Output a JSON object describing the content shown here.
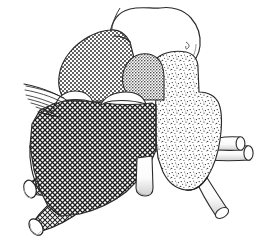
{
  "figure": {
    "title": "Anatomical line drawing of brainstem with nerve roots",
    "domain": "Diagram",
    "width": 261,
    "height": 243,
    "background_color": "#ffffff",
    "line_color": "#1a1a1a",
    "style": "pen-and-ink stipple and crosshatch medical illustration",
    "caption": ""
  },
  "palette": {
    "outline": "#262626",
    "white_fill": "#ffffff",
    "dark_crosshatch": "#4a4a4a",
    "medium_dot": "#8c8c8c",
    "light_stipple": "#b8b8b8",
    "mid_gray_knob": "#707070",
    "tube_shadow": "#d8d8d8"
  },
  "regions": [
    {
      "id": "upper-white-lobe",
      "name": "upper-white-lobe",
      "label": "Upper unshaded lobe",
      "texture": "none",
      "fill": "#ffffff",
      "bbox": [
        108,
        6,
        96,
        60
      ]
    },
    {
      "id": "upper-left-dotted-mass",
      "name": "upper-left-dotted-mass",
      "label": "Upper left medium-dot mass",
      "texture": "medium-dot",
      "fill": "#8c8c8c",
      "bbox": [
        60,
        32,
        80,
        80
      ]
    },
    {
      "id": "central-dark-knob",
      "name": "central-dark-knob",
      "label": "Central mid-gray knob",
      "texture": "fine-dot",
      "fill": "#707070",
      "bbox": [
        122,
        54,
        46,
        50
      ]
    },
    {
      "id": "left-dark-crosshatch-body",
      "name": "left-dark-crosshatch-body",
      "label": "Left dark crosshatched body",
      "texture": "crosshatch",
      "fill": "#4a4a4a",
      "bbox": [
        20,
        100,
        140,
        130
      ]
    },
    {
      "id": "right-light-stipple-body",
      "name": "right-light-stipple-body",
      "label": "Right light stippled body",
      "texture": "stipple",
      "fill": "#b8b8b8",
      "bbox": [
        152,
        50,
        70,
        140
      ]
    }
  ],
  "tubes": [
    {
      "id": "tube-left-1",
      "name": "left-root-tube-1",
      "label": "Left root 1 (upper)",
      "texture": "crosshatch",
      "angle_deg": 186
    },
    {
      "id": "tube-left-2",
      "name": "left-root-tube-2",
      "label": "Left root 2",
      "texture": "crosshatch",
      "angle_deg": 192
    },
    {
      "id": "tube-left-3",
      "name": "left-root-tube-3",
      "label": "Left root 3",
      "texture": "crosshatch",
      "angle_deg": 205
    },
    {
      "id": "tube-left-4",
      "name": "left-root-tube-4",
      "label": "Left root 4 (lower)",
      "texture": "crosshatch",
      "angle_deg": 218
    },
    {
      "id": "tube-center-down",
      "name": "center-descending-tube",
      "label": "Central descending tube",
      "texture": "none",
      "angle_deg": 268
    },
    {
      "id": "tube-right-upper-a",
      "name": "right-lateral-tube-a",
      "label": "Right lateral tube A",
      "texture": "none",
      "angle_deg": 8
    },
    {
      "id": "tube-right-upper-b",
      "name": "right-lateral-tube-b",
      "label": "Right lateral tube B",
      "texture": "none",
      "angle_deg": 14
    },
    {
      "id": "tube-right-down",
      "name": "right-descending-tube",
      "label": "Right descending tube",
      "texture": "none",
      "angle_deg": 300
    }
  ],
  "fibers": {
    "name": "left-nerve-fiber-bundle",
    "label": "Splayed fine fiber bundle (upper left)",
    "count": 7,
    "bbox": [
      24,
      84,
      48,
      28
    ]
  },
  "crescents": [
    {
      "id": "crescent-1",
      "name": "white-crescent-left",
      "label": "Left white crescent notch"
    },
    {
      "id": "crescent-2",
      "name": "white-crescent-right",
      "label": "Right white crescent notch"
    }
  ],
  "annotations": {
    "has_text_labels": false,
    "has_axes": false,
    "has_legend": false,
    "visible_text": ""
  }
}
